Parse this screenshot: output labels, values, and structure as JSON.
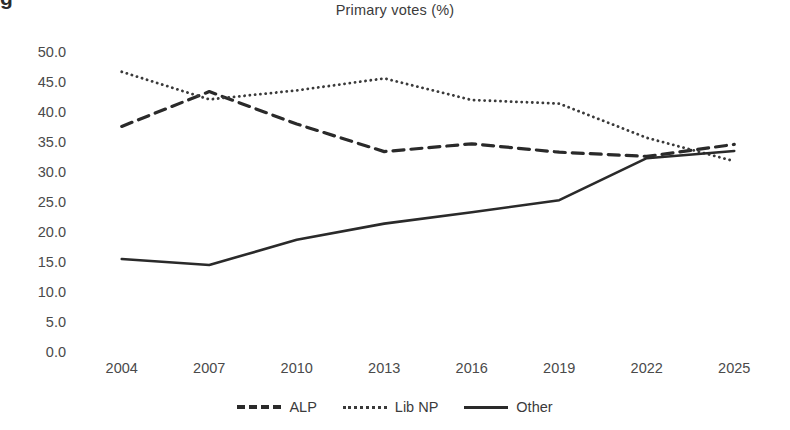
{
  "figure": {
    "cropped_caption_glyph": "g"
  },
  "chart_data": {
    "type": "line",
    "title": "Primary votes (%)",
    "xlabel": "",
    "ylabel": "",
    "categories": [
      "2004",
      "2007",
      "2010",
      "2013",
      "2016",
      "2019",
      "2022",
      "2025"
    ],
    "ylim": [
      0.0,
      50.0
    ],
    "ytick_step": 5.0,
    "ytick_labels": [
      "50.0",
      "45.0",
      "40.0",
      "35.0",
      "30.0",
      "25.0",
      "20.0",
      "15.0",
      "10.0",
      "5.0",
      "0.0"
    ],
    "ytick_values": [
      50.0,
      45.0,
      40.0,
      35.0,
      30.0,
      25.0,
      20.0,
      15.0,
      10.0,
      5.0,
      0.0
    ],
    "grid": false,
    "legend_position": "bottom",
    "series": [
      {
        "name": "ALP",
        "style": "dashed",
        "color": "#2a2a2a",
        "values": [
          37.6,
          43.4,
          38.0,
          33.4,
          34.7,
          33.3,
          32.6,
          34.6
        ]
      },
      {
        "name": "Lib NP",
        "style": "dotted",
        "color": "#3a3a3a",
        "values": [
          46.7,
          42.1,
          43.6,
          45.6,
          42.0,
          41.4,
          35.7,
          31.8
        ]
      },
      {
        "name": "Other",
        "style": "solid",
        "color": "#2a2a2a",
        "values": [
          15.5,
          14.5,
          18.7,
          21.4,
          23.3,
          25.3,
          32.3,
          33.5
        ]
      }
    ]
  }
}
